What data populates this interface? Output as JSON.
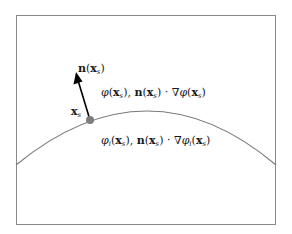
{
  "diagram": {
    "frame": {
      "x": 16,
      "y": 15,
      "width": 260,
      "height": 210,
      "stroke": "#8a8a8a"
    },
    "interface_curve": {
      "start": [
        16,
        165
      ],
      "control": [
        148,
        57
      ],
      "end": [
        276,
        165
      ],
      "stroke": "#7a7a7a"
    },
    "point": {
      "cx": 90,
      "cy": 120,
      "r": 4,
      "fill": "#7d7d7d"
    },
    "normal_arrow": {
      "from": [
        90,
        120
      ],
      "to": [
        76,
        74
      ],
      "stroke": "#000000"
    },
    "labels": {
      "normal": "n(x_s)",
      "point": "x_s",
      "outer_side": "φ(x_s), n(x_s) · ∇φ(x_s)",
      "inner_side": "φ_i(x_s), n(x_s) · ∇φ_i(x_s)"
    },
    "label_parts": {
      "n": "n",
      "x": "x",
      "s": "s",
      "i": "i",
      "phi": "φ",
      "nabla": "∇",
      "dot": "·",
      "lp": "(",
      "rp": ")",
      "comma": ", "
    }
  }
}
